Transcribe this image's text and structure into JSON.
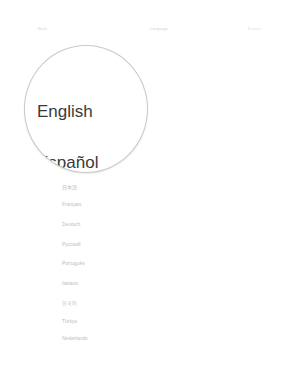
{
  "nav": {
    "back_label": "Back",
    "title": "Language",
    "right_label": "Done"
  },
  "magnifier": {
    "items": [
      "English",
      "Español"
    ]
  },
  "languages": [
    {
      "label": "日本語"
    },
    {
      "label": "Français"
    },
    {
      "label": "Deutsch"
    },
    {
      "label": "Русский"
    },
    {
      "label": "Português"
    },
    {
      "label": "Italiano"
    },
    {
      "label": "한국어"
    },
    {
      "label": "Türkçe"
    },
    {
      "label": "Nederlands"
    }
  ]
}
